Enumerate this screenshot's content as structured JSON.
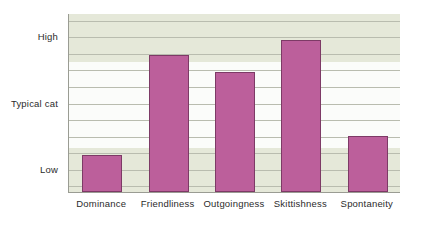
{
  "chart_data": {
    "type": "bar",
    "title": "",
    "subtitle": "",
    "xlabel": "",
    "ylabel": "",
    "categories": [
      "Dominance",
      "Friendliness",
      "Outgoingness",
      "Skittishness",
      "Spontaneity"
    ],
    "values": [
      0.21,
      1.72,
      1.46,
      1.95,
      0.5
    ],
    "ytick_labels": [
      "High",
      "Typical cat",
      "Low"
    ],
    "ytick_values": [
      2,
      1,
      0
    ],
    "ylim": [
      -0.35,
      2.35
    ],
    "grid": true,
    "legend": false,
    "bar_color": "#bc5f9b",
    "bar_border_color": "#7d3a66",
    "plot_background": "#fbfcfa",
    "band_color": "#e5e8d9",
    "gridline_color": "#b9bcaf",
    "axis_color": "#9a9c93",
    "text_color": "#2b2b2b"
  },
  "axis": {
    "y_ticks": [
      {
        "label": "High",
        "value": 2
      },
      {
        "label": "Typical cat",
        "value": 1
      },
      {
        "label": "Low",
        "value": 0
      }
    ],
    "x_ticks": [
      {
        "label": "Dominance"
      },
      {
        "label": "Friendliness"
      },
      {
        "label": "Outgoingness"
      },
      {
        "label": "Skittishness"
      },
      {
        "label": "Spontaneity"
      }
    ]
  }
}
